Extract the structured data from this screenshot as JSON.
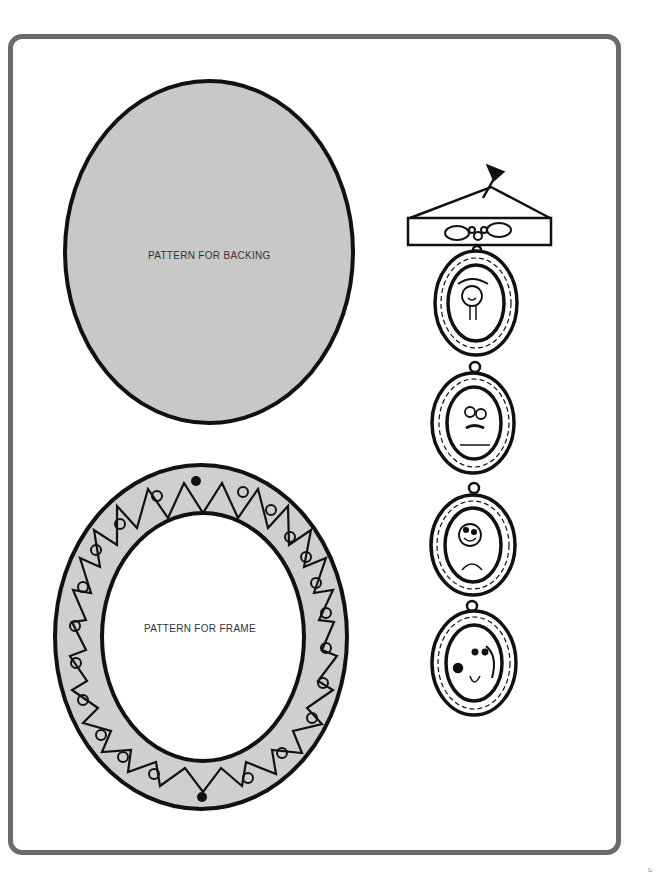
{
  "page": {
    "backing_pattern": {
      "label": "PATTERN FOR BACKING",
      "fill_color": "#c8c8c8",
      "outline_color": "#111111"
    },
    "frame_pattern": {
      "label": "PATTERN FOR FRAME",
      "fill_color": "#cfcfcf",
      "inner_color": "#ffffff",
      "outline_color": "#111111"
    },
    "illustration": {
      "description": "Hanging chain of four decorated oval frames with portraits",
      "portraits": [
        "smiling-girl",
        "man-with-glasses-and-mustache",
        "smiling-boy",
        "dog-with-tongue-out"
      ]
    },
    "border_color": "#6b6b6b",
    "corner_mark": "ಲ"
  }
}
